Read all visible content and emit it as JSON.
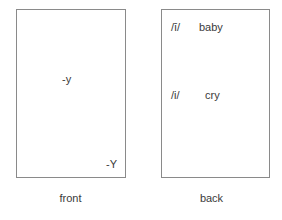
{
  "figure": {
    "name": "flashcard-front-back",
    "background_color": "#ffffff",
    "border_color": "#8a8a8a",
    "text_color": "#3a3a3a"
  },
  "front_card": {
    "caption": "front",
    "primary_label": "-y",
    "corner_label": "-Y"
  },
  "back_card": {
    "caption": "back",
    "entries": [
      {
        "phoneme": "/ī/",
        "gloss": "baby"
      },
      {
        "phoneme": "/i/",
        "gloss": "cry"
      }
    ]
  }
}
